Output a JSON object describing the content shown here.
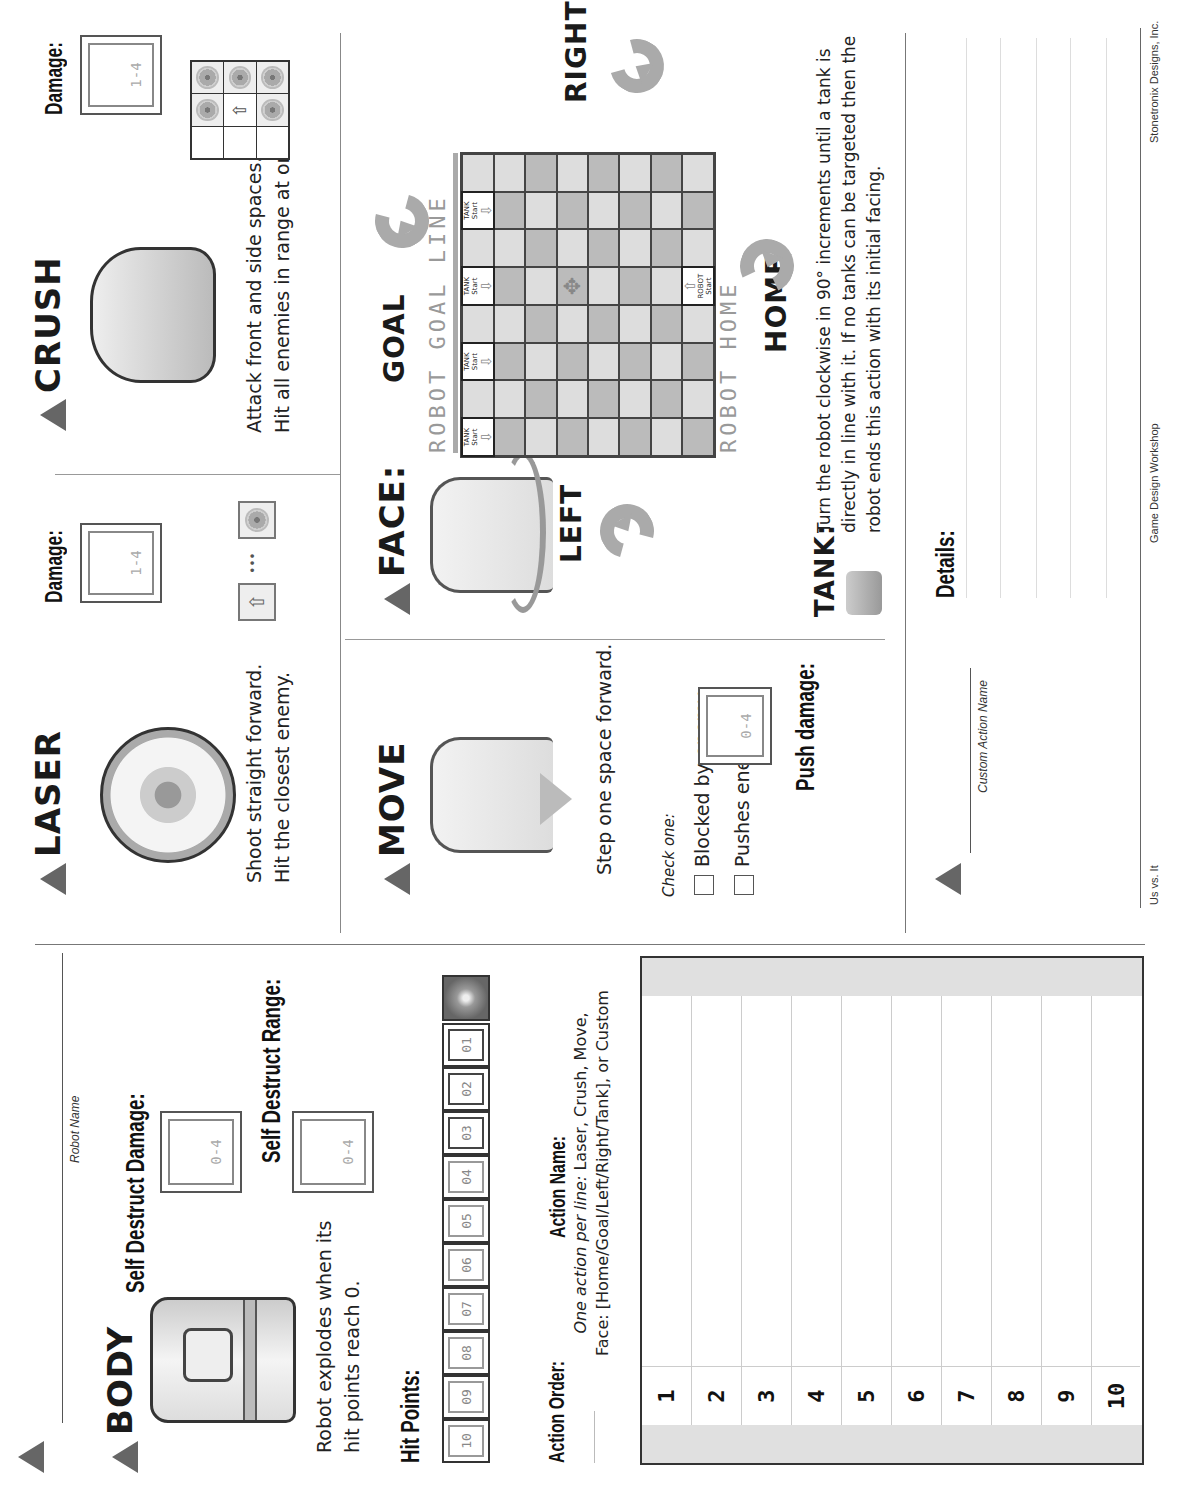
{
  "robot_name": {
    "label": "Robot Name",
    "value": ""
  },
  "body": {
    "title": "BODY",
    "description": "Robot explodes when its hit points reach 0.",
    "self_destruct_damage": {
      "label": "Self Destruct Damage:",
      "range": "0-4",
      "value": ""
    },
    "self_destruct_range": {
      "label": "Self Destruct Range:",
      "range": "0-4",
      "value": ""
    }
  },
  "hit_points": {
    "label": "Hit Points:",
    "boxes": [
      "10",
      "09",
      "08",
      "07",
      "06",
      "05",
      "04",
      "03",
      "02",
      "01"
    ],
    "end_icon": "explosion-icon"
  },
  "action_order": {
    "label": "Action Order:",
    "name_label": "Action Name:",
    "hint_italic": "One action per line:",
    "hint_rest": "Laser, Crush, Move,",
    "hint_line2": "Face: [Home/Goal/Left/Right/Tank], or Custom",
    "rows": [
      {
        "num": "1",
        "value": ""
      },
      {
        "num": "2",
        "value": ""
      },
      {
        "num": "3",
        "value": ""
      },
      {
        "num": "4",
        "value": ""
      },
      {
        "num": "5",
        "value": ""
      },
      {
        "num": "6",
        "value": ""
      },
      {
        "num": "7",
        "value": ""
      },
      {
        "num": "8",
        "value": ""
      },
      {
        "num": "9",
        "value": ""
      },
      {
        "num": "10",
        "value": ""
      }
    ]
  },
  "laser": {
    "title": "LASER",
    "line1": "Shoot straight forward.",
    "line2": "Hit the closest enemy.",
    "damage_label": "Damage:",
    "damage_range": "1-4",
    "damage_value": "",
    "range_ellipsis": "•••"
  },
  "crush": {
    "title": "CRUSH",
    "line1": "Attack front and side spaces.",
    "line2": "Hit all enemies in range at once.",
    "damage_label": "Damage:",
    "damage_range": "1-4",
    "damage_value": ""
  },
  "move": {
    "title": "MOVE",
    "description": "Step one space forward.",
    "check_label": "Check one:",
    "options": [
      "Blocked by enemy",
      "Pushes enemy"
    ],
    "push_damage_label": "Push damage:",
    "push_damage_range": "0-4",
    "push_damage_value": ""
  },
  "face": {
    "title": "FACE:",
    "goal": "GOAL",
    "left": "LEFT",
    "right": "RIGHT",
    "home": "HOME",
    "goal_line_label": "ROBOT GOAL LINE",
    "home_label": "ROBOT HOME",
    "tank_start": "TANK Start",
    "robot_start": "ROBOT Start",
    "tank_label": "TANK:",
    "tank_description": "Turn the robot clockwise in 90° increments until a tank is directly in line with it. If no tanks can be targeted then the robot ends this action with its initial facing."
  },
  "custom": {
    "name_label": "Custom Action Name",
    "name_value": "",
    "details_label": "Details:",
    "details_value": ""
  },
  "footer": {
    "left": "Us vs. It",
    "center": "Game Design Workshop",
    "right": "Stonetronix Designs, Inc."
  }
}
